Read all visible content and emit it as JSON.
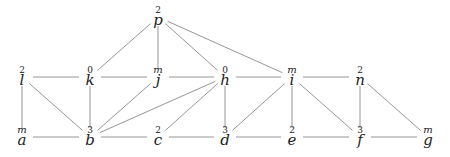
{
  "graph": {
    "nodes": [
      {
        "id": "p",
        "label": "p",
        "sup": "2",
        "x": 158,
        "y": 20
      },
      {
        "id": "l",
        "label": "l",
        "sup": "2",
        "x": 22,
        "y": 80
      },
      {
        "id": "k",
        "label": "k",
        "sup": "0",
        "x": 90,
        "y": 80
      },
      {
        "id": "j",
        "label": "j",
        "sup": "m",
        "x": 158,
        "y": 80
      },
      {
        "id": "h",
        "label": "h",
        "sup": "0",
        "x": 225,
        "y": 80
      },
      {
        "id": "i",
        "label": "i",
        "sup": "m",
        "x": 292,
        "y": 80
      },
      {
        "id": "n",
        "label": "n",
        "sup": "2",
        "x": 360,
        "y": 80
      },
      {
        "id": "a",
        "label": "a",
        "sup": "m",
        "x": 22,
        "y": 140
      },
      {
        "id": "b",
        "label": "b",
        "sup": "3",
        "x": 90,
        "y": 140
      },
      {
        "id": "c",
        "label": "c",
        "sup": "2",
        "x": 158,
        "y": 140
      },
      {
        "id": "d",
        "label": "d",
        "sup": "3",
        "x": 225,
        "y": 140
      },
      {
        "id": "e",
        "label": "e",
        "sup": "2",
        "x": 292,
        "y": 140
      },
      {
        "id": "f",
        "label": "f",
        "sup": "3",
        "x": 360,
        "y": 140
      },
      {
        "id": "g",
        "label": "g",
        "sup": "m",
        "x": 428,
        "y": 140
      }
    ],
    "edges": [
      [
        "p",
        "k"
      ],
      [
        "p",
        "j"
      ],
      [
        "p",
        "h"
      ],
      [
        "p",
        "i"
      ],
      [
        "l",
        "k"
      ],
      [
        "k",
        "j"
      ],
      [
        "j",
        "h"
      ],
      [
        "h",
        "i"
      ],
      [
        "i",
        "n"
      ],
      [
        "l",
        "a"
      ],
      [
        "l",
        "b"
      ],
      [
        "k",
        "b"
      ],
      [
        "j",
        "b"
      ],
      [
        "h",
        "b"
      ],
      [
        "h",
        "c"
      ],
      [
        "h",
        "d"
      ],
      [
        "i",
        "d"
      ],
      [
        "i",
        "e"
      ],
      [
        "i",
        "f"
      ],
      [
        "n",
        "f"
      ],
      [
        "n",
        "g"
      ],
      [
        "a",
        "b"
      ],
      [
        "b",
        "c"
      ],
      [
        "c",
        "d"
      ],
      [
        "d",
        "e"
      ],
      [
        "e",
        "f"
      ],
      [
        "f",
        "g"
      ]
    ]
  }
}
